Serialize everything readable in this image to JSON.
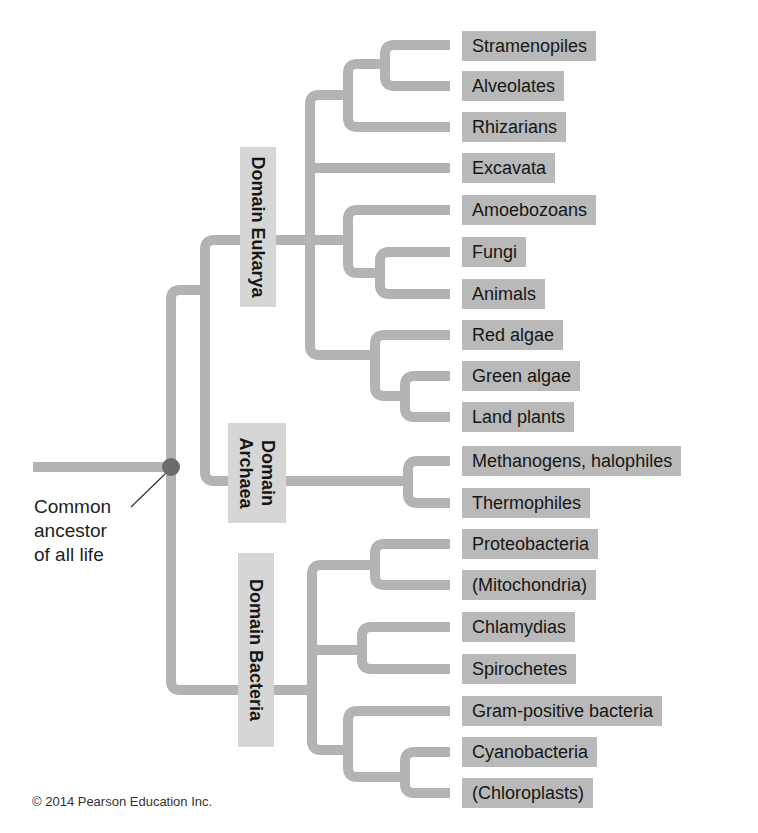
{
  "diagram": {
    "type": "phylogenetic-tree",
    "line_color": "#b3b3b3",
    "leaf_box_color": "#b9b9b9",
    "domain_box_color": "#d6d6d6",
    "node_color": "#666666",
    "root_label": [
      "Common",
      "ancestor",
      "of all life"
    ],
    "domains": [
      {
        "name": "Domain Eukarya",
        "lines": [
          "Domain Eukarya"
        ]
      },
      {
        "name": "Domain Archaea",
        "lines": [
          "Domain",
          "Archaea"
        ]
      },
      {
        "name": "Domain Bacteria",
        "lines": [
          "Domain Bacteria"
        ]
      }
    ],
    "leaves": [
      {
        "label": "Stramenopiles",
        "domain": "Eukarya"
      },
      {
        "label": "Alveolates",
        "domain": "Eukarya"
      },
      {
        "label": "Rhizarians",
        "domain": "Eukarya"
      },
      {
        "label": "Excavata",
        "domain": "Eukarya"
      },
      {
        "label": "Amoebozoans",
        "domain": "Eukarya"
      },
      {
        "label": "Fungi",
        "domain": "Eukarya"
      },
      {
        "label": "Animals",
        "domain": "Eukarya"
      },
      {
        "label": "Red algae",
        "domain": "Eukarya"
      },
      {
        "label": "Green algae",
        "domain": "Eukarya"
      },
      {
        "label": "Land plants",
        "domain": "Eukarya"
      },
      {
        "label": "Methanogens, halophiles",
        "domain": "Archaea"
      },
      {
        "label": "Thermophiles",
        "domain": "Archaea"
      },
      {
        "label": "Proteobacteria",
        "domain": "Bacteria"
      },
      {
        "label": "(Mitochondria)",
        "domain": "Bacteria"
      },
      {
        "label": "Chlamydias",
        "domain": "Bacteria"
      },
      {
        "label": "Spirochetes",
        "domain": "Bacteria"
      },
      {
        "label": "Gram-positive bacteria",
        "domain": "Bacteria"
      },
      {
        "label": "Cyanobacteria",
        "domain": "Bacteria"
      },
      {
        "label": "(Chloroplasts)",
        "domain": "Bacteria"
      }
    ]
  },
  "footer": {
    "copyright": "© 2014 Pearson Education Inc."
  }
}
